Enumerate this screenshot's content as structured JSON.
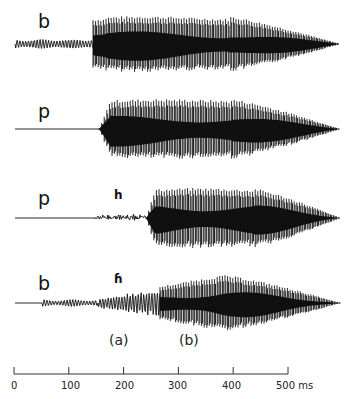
{
  "figure": {
    "rows": [
      {
        "id": "row1",
        "segment_label": "b",
        "phonation_label": "",
        "baseline_y": 44,
        "prevoice": {
          "x0": 15,
          "x1": 93,
          "amp": 5
        },
        "aspiration": null,
        "vowel": {
          "x0": 93,
          "x1": 340,
          "peak_amp": 28,
          "period": 2.6
        }
      },
      {
        "id": "row2",
        "segment_label": "p",
        "phonation_label": "",
        "baseline_y": 129,
        "prevoice": null,
        "aspiration": null,
        "vowel": {
          "x0": 99,
          "x1": 340,
          "peak_amp": 30,
          "period": 2.6
        }
      },
      {
        "id": "row3",
        "segment_label": "p",
        "phonation_label": "h",
        "baseline_y": 218,
        "prevoice": null,
        "aspiration": {
          "x0": 95,
          "x1": 146,
          "amp": 3
        },
        "vowel": {
          "x0": 146,
          "x1": 340,
          "peak_amp": 30,
          "period": 2.6
        }
      },
      {
        "id": "row4",
        "segment_label": "b",
        "phonation_label": "ɦ",
        "baseline_y": 303,
        "prevoice": {
          "x0": 42,
          "x1": 98,
          "amp": 3.5
        },
        "aspiration": {
          "x0": 98,
          "x1": 160,
          "amp": 10,
          "breathy": true
        },
        "vowel": {
          "x0": 160,
          "x1": 340,
          "peak_amp": 28,
          "period": 2.6
        }
      }
    ],
    "region_labels": [
      {
        "text": "(a)",
        "x": 120,
        "y": 344
      },
      {
        "text": "(b)",
        "x": 190,
        "y": 344
      }
    ],
    "time_axis": {
      "y": 374,
      "x_start": 14,
      "x_end": 288,
      "ticks": [
        "0",
        "100",
        "200",
        "300",
        "400",
        "500 ms"
      ],
      "unit": "ms",
      "range": [
        0,
        500
      ]
    },
    "colors": {
      "waveform": "#111111",
      "axis": "#333333",
      "background": "#ffffff"
    }
  }
}
